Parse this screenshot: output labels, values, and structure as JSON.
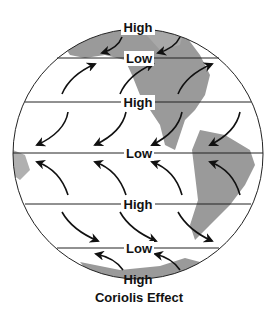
{
  "diagram": {
    "caption": "Coriolis Effect",
    "labels": {
      "north_pole": "High",
      "north_60": "Low",
      "north_30": "High",
      "equator": "Low",
      "south_30": "High",
      "south_60": "Low",
      "south_pole": "High"
    },
    "colors": {
      "land": "#9a9a9a",
      "lines": "#222222",
      "arrows": "#111111",
      "background": "#ffffff"
    }
  }
}
